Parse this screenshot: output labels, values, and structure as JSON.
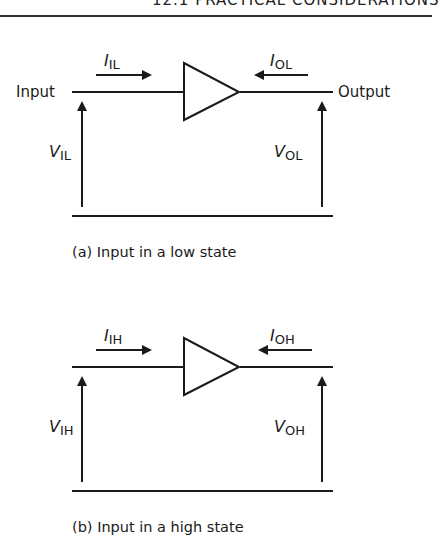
{
  "running_head": "12.1 PRACTICAL CONSIDERATIONS",
  "figures": [
    {
      "input_label": "Input",
      "output_label": "Output",
      "current_in": {
        "main": "I",
        "sub": "IL"
      },
      "current_out": {
        "main": "I",
        "sub": "OL"
      },
      "voltage_in": {
        "main": "V",
        "sub": "IL"
      },
      "voltage_out": {
        "main": "V",
        "sub": "OL"
      },
      "caption": "(a) Input in a low state"
    },
    {
      "input_label": "",
      "output_label": "",
      "current_in": {
        "main": "I",
        "sub": "IH"
      },
      "current_out": {
        "main": "I",
        "sub": "OH"
      },
      "voltage_in": {
        "main": "V",
        "sub": "IH"
      },
      "voltage_out": {
        "main": "V",
        "sub": "OH"
      },
      "caption": "(b) Input in a high state"
    }
  ],
  "colors": {
    "ink": "#1a1a1a",
    "background": "#ffffff"
  }
}
